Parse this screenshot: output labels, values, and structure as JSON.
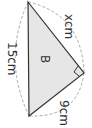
{
  "diagram": {
    "shape": "right triangle",
    "region_label": "B",
    "sides": {
      "hypotenuse": "15cm",
      "leg_upper": "xcm",
      "leg_lower": "9cm"
    },
    "right_angle_marker": true,
    "colors": {
      "fill": "#e6e6e6",
      "stroke": "#333333",
      "dashed": "#aaaaaa"
    }
  }
}
